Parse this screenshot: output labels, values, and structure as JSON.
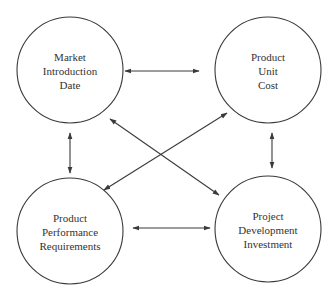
{
  "diagram": {
    "type": "relationship-diagram",
    "colors": {
      "stroke": "#3a3a3a",
      "text": "#333333",
      "background": "#ffffff"
    },
    "nodes": [
      {
        "id": "market-introduction-date",
        "lines": [
          "Market",
          "Introduction",
          "Date"
        ],
        "cx": 70,
        "cy": 70,
        "r": 53
      },
      {
        "id": "product-unit-cost",
        "lines": [
          "Product",
          "Unit",
          "Cost"
        ],
        "cx": 268,
        "cy": 70,
        "r": 53
      },
      {
        "id": "product-performance-requirements",
        "lines": [
          "Product",
          "Performance",
          "Requirements"
        ],
        "cx": 70,
        "cy": 231,
        "r": 53
      },
      {
        "id": "project-development-investment",
        "lines": [
          "Project",
          "Development",
          "Investment"
        ],
        "cx": 268,
        "cy": 229,
        "r": 53
      }
    ],
    "edges": [
      {
        "from": "market-introduction-date",
        "to": "product-unit-cost",
        "direction": "both"
      },
      {
        "from": "market-introduction-date",
        "to": "product-performance-requirements",
        "direction": "both"
      },
      {
        "from": "product-unit-cost",
        "to": "project-development-investment",
        "direction": "both"
      },
      {
        "from": "product-performance-requirements",
        "to": "project-development-investment",
        "direction": "both"
      },
      {
        "from": "market-introduction-date",
        "to": "project-development-investment",
        "direction": "both"
      },
      {
        "from": "product-unit-cost",
        "to": "product-performance-requirements",
        "direction": "both"
      }
    ]
  }
}
